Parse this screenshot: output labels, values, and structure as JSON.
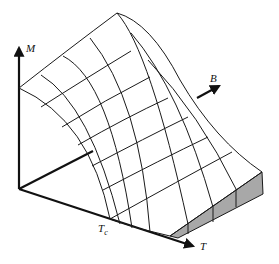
{
  "diagram": {
    "axes": {
      "m": {
        "label": "M"
      },
      "b": {
        "label": "B"
      },
      "t": {
        "label": "T"
      }
    },
    "annotations": {
      "tc": {
        "label": "T",
        "subscript": "c"
      }
    },
    "colors": {
      "line": "#1a1a1a",
      "shade": "#a8a8a8",
      "background": "#ffffff"
    }
  }
}
